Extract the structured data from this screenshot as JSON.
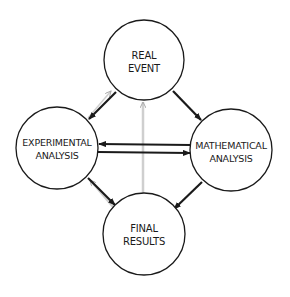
{
  "diagram": {
    "colors": {
      "background": "#ffffff",
      "stroke": "#1a1a1a",
      "faint_stroke": "#c8c8c8"
    },
    "nodes": [
      {
        "id": "real_event",
        "line1": "REAL",
        "line2": "EVENT",
        "cx": 144,
        "cy": 60,
        "r": 40
      },
      {
        "id": "experimental_analysis",
        "line1": "EXPERIMENTAL",
        "line2": "ANALYSIS",
        "cx": 57,
        "cy": 148,
        "r": 41
      },
      {
        "id": "mathematical_analysis",
        "line1": "MATHEMATICAL",
        "line2": "ANALYSIS",
        "cx": 231,
        "cy": 150,
        "r": 41
      },
      {
        "id": "final_results",
        "line1": "FINAL",
        "line2": "RESULTS",
        "cx": 144,
        "cy": 234,
        "r": 41
      }
    ],
    "edges": [
      {
        "from": "real_event",
        "to": "experimental_analysis",
        "style": "solid"
      },
      {
        "from": "real_event",
        "to": "mathematical_analysis",
        "style": "solid"
      },
      {
        "from": "mathematical_analysis",
        "to": "experimental_analysis",
        "style": "solid"
      },
      {
        "from": "experimental_analysis",
        "to": "mathematical_analysis",
        "style": "solid"
      },
      {
        "from": "experimental_analysis",
        "to": "final_results",
        "style": "solid"
      },
      {
        "from": "mathematical_analysis",
        "to": "final_results",
        "style": "solid"
      },
      {
        "from": "final_results",
        "to": "real_event",
        "style": "faint"
      },
      {
        "from": "experimental_analysis",
        "to": "real_event",
        "style": "faint"
      },
      {
        "from": "final_results",
        "to": "experimental_analysis",
        "style": "faint"
      }
    ]
  }
}
